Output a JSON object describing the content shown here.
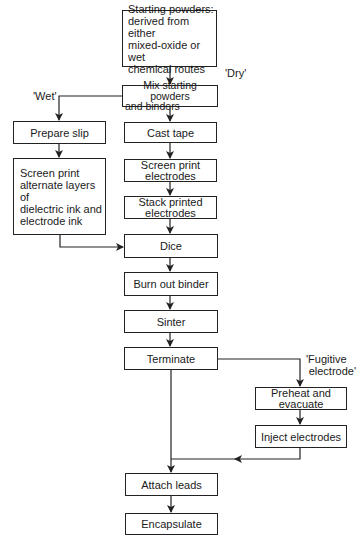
{
  "diagram": {
    "type": "flowchart",
    "title": "",
    "nodes": {
      "start": "Starting powders: derived from either mixed-oxide or wet chemical routes",
      "mix": "Mix starting powders and binders",
      "prepare_slip": "Prepare slip",
      "screen_print_layers": "Screen print alternate layers of dielectric ink and electrode ink",
      "cast_tape": "Cast tape",
      "screen_print_electrodes": "Screen print electrodes",
      "stack_printed_electrodes": "Stack printed electrodes",
      "dice": "Dice",
      "burn_out_binder": "Burn out binder",
      "sinter": "Sinter",
      "terminate": "Terminate",
      "preheat_evacuate": "Preheat and evacuate",
      "inject_electrodes": "Inject electrodes",
      "attach_leads": "Attach leads",
      "encapsulate": "Encapsulate"
    },
    "branch_labels": {
      "dry": "'Dry'",
      "wet": "'Wet'",
      "fugitive_line1": "'Fugitive",
      "fugitive_line2": "electrode'"
    },
    "edges": [
      {
        "from": "start",
        "to": "mix"
      },
      {
        "from": "mix",
        "to": "cast_tape",
        "label": "'Dry'"
      },
      {
        "from": "mix",
        "to": "prepare_slip",
        "label": "'Wet'"
      },
      {
        "from": "prepare_slip",
        "to": "screen_print_layers"
      },
      {
        "from": "screen_print_layers",
        "to": "dice"
      },
      {
        "from": "cast_tape",
        "to": "screen_print_electrodes"
      },
      {
        "from": "screen_print_electrodes",
        "to": "stack_printed_electrodes"
      },
      {
        "from": "stack_printed_electrodes",
        "to": "dice"
      },
      {
        "from": "dice",
        "to": "burn_out_binder"
      },
      {
        "from": "burn_out_binder",
        "to": "sinter"
      },
      {
        "from": "sinter",
        "to": "terminate"
      },
      {
        "from": "terminate",
        "to": "attach_leads"
      },
      {
        "from": "terminate",
        "to": "preheat_evacuate",
        "label": "'Fugitive electrode'"
      },
      {
        "from": "preheat_evacuate",
        "to": "inject_electrodes"
      },
      {
        "from": "inject_electrodes",
        "to": "attach_leads"
      },
      {
        "from": "attach_leads",
        "to": "encapsulate"
      }
    ]
  },
  "lines": {
    "start": [
      "Starting powders:",
      "derived from either",
      "mixed-oxide or wet",
      "chemical  routes"
    ],
    "mix": [
      "Mix starting powders",
      "and binders"
    ],
    "screen_print_layers": [
      "Screen print",
      "alternate layers of",
      "dielectric ink and",
      "electrode ink"
    ],
    "screen_print_electrodes": [
      "Screen print",
      "electrodes"
    ],
    "stack_printed_electrodes": [
      "Stack printed",
      "electrodes"
    ],
    "preheat_evacuate": [
      "Preheat and",
      "evacuate"
    ]
  },
  "colors": {
    "stroke": "#222222",
    "background": "#ffffff",
    "text": "#1a1a1a"
  }
}
